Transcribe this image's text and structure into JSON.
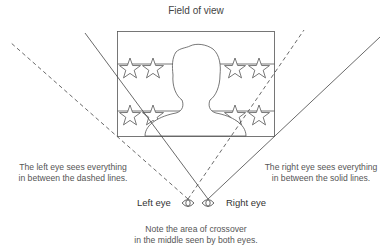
{
  "title": "Field of view",
  "left_caption": [
    "The left eye sees everything",
    "in between the dashed lines."
  ],
  "right_caption": [
    "The right eye sees everything",
    "in between the solid lines."
  ],
  "left_eye_label": "Left eye",
  "right_eye_label": "Right eye",
  "note": [
    "Note the area of crossover",
    "in the middle seen by both eyes."
  ],
  "colors": {
    "line": "#444444",
    "text": "#555555",
    "background": "#ffffff"
  }
}
